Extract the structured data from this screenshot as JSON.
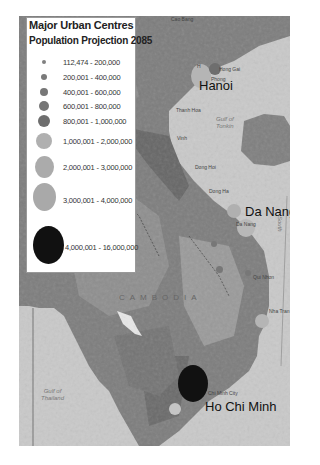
{
  "legend": {
    "title": "Major Urban Centres",
    "subtitle": "Population Projection 2085",
    "classes": [
      {
        "label": "112,474 - 200,000",
        "color": "#808080",
        "size": 4
      },
      {
        "label": "200,001 - 400,000",
        "color": "#7a7a7a",
        "size": 6
      },
      {
        "label": "400,001 - 600,000",
        "color": "#777777",
        "size": 8
      },
      {
        "label": "600,001 - 800,000",
        "color": "#767676",
        "size": 10
      },
      {
        "label": "800,001 - 1,000,000",
        "color": "#6e6e6e",
        "size": 12
      },
      {
        "label": "1,000,001 - 2,000,000",
        "color": "#b0b0b0",
        "size": 14
      },
      {
        "label": "2,000,001 - 3,000,000",
        "color": "#ababab",
        "size": 20
      },
      {
        "label": "3,000,001 - 4,000,000",
        "color": "#a9a9a9",
        "size": 24
      },
      {
        "label": "4,000,001 - 16,000,000",
        "color": "#111111",
        "size": 32
      }
    ]
  },
  "map": {
    "city_labels": {
      "hanoi": "Hanoi",
      "da_nang": "Da Nang",
      "ho_chi_minh": "Ho Chi Minh"
    },
    "place_labels": {
      "cao_bang": "Cao Bang",
      "hong_gai": "Hong Gai",
      "haiphong": "Phong",
      "thanh_hoa": "Thanh Hoa",
      "vinh": "Vinh",
      "dong_hoi": "Dong Hoi",
      "dong_ha": "Dong Ha",
      "da_nang_small": "Da Nang",
      "qui_nhon": "Qui Nhon",
      "nha_trang": "Nha Tran",
      "hcmc_small": "Chi Minh City",
      "h_prefix": "H"
    },
    "sea_labels": {
      "gulf_tonkin": "Gulf of\nTonkin",
      "gulf_thailand": "Gulf of\nThailand",
      "south": "South"
    },
    "country_labels": {
      "cambodia": "CAMBODIA"
    }
  }
}
